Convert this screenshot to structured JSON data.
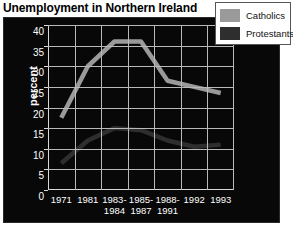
{
  "title": "Unemployment in Northern Ireland",
  "legend": {
    "items": [
      {
        "label": "Catholics",
        "color": "#9a9a9a"
      },
      {
        "label": "Protestants",
        "color": "#2e2e2e"
      }
    ]
  },
  "axes": {
    "ylabel": "percent",
    "yticks": [
      "0",
      "5",
      "10",
      "15",
      "20",
      "25",
      "30",
      "35",
      "40"
    ],
    "xticks": [
      "1971",
      "1981",
      "1983-\n1984",
      "1985-\n1987",
      "1988-\n1991",
      "1992",
      "1993"
    ]
  },
  "chart_data": {
    "type": "line",
    "title": "Unemployment in Northern Ireland",
    "xlabel": "",
    "ylabel": "percent",
    "ylim": [
      0,
      40
    ],
    "ytick_step": 5,
    "grid": true,
    "legend_position": "top-right",
    "categories": [
      "1971",
      "1981",
      "1983-1984",
      "1985-1987",
      "1988-1991",
      "1992",
      "1993"
    ],
    "series": [
      {
        "name": "Catholics",
        "color": "#9a9a9a",
        "values": [
          17.5,
          30,
          36,
          36,
          26.5,
          25,
          23.5
        ]
      },
      {
        "name": "Protestants",
        "color": "#2e2e2e",
        "values": [
          6.5,
          12,
          15,
          14.5,
          12,
          10.5,
          11
        ]
      }
    ]
  }
}
